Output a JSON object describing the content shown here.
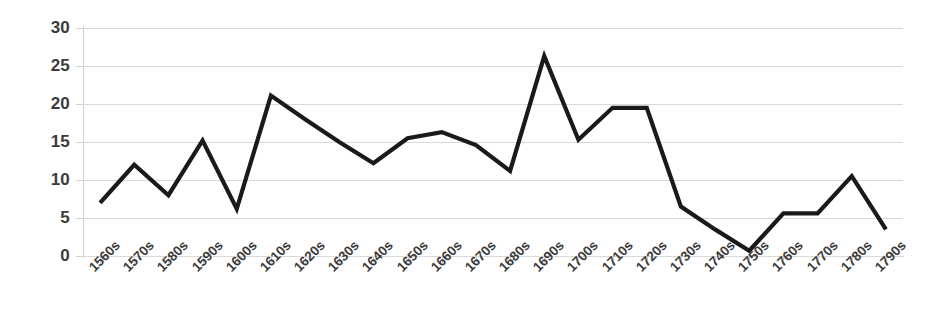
{
  "chart_data": {
    "type": "line",
    "title": "",
    "subtitle": "",
    "xlabel": "",
    "ylabel": "",
    "ylim": [
      0,
      30
    ],
    "ytick_step": 5,
    "grid": true,
    "legend": "none",
    "line_color": "#1a1a1a",
    "grid_color": "#d9d9d9",
    "axis_color": "#cfcfcf",
    "label_color": "#3b3b3b",
    "background": "#ffffff",
    "yticks": [
      "0",
      "5",
      "10",
      "15",
      "20",
      "25",
      "30"
    ],
    "categories": [
      "1560s",
      "1570s",
      "1580s",
      "1590s",
      "1600s",
      "1610s",
      "1620s",
      "1630s",
      "1640s",
      "1650s",
      "1660s",
      "1670s",
      "1680s",
      "1690s",
      "1700s",
      "1710s",
      "1720s",
      "1730s",
      "1740s",
      "1750s",
      "1760s",
      "1770s",
      "1780s",
      "1790s"
    ],
    "series": [
      {
        "name": "series-1",
        "values": [
          7.0,
          12.0,
          8.0,
          15.2,
          6.2,
          21.1,
          18.0,
          15.0,
          12.2,
          15.5,
          16.3,
          14.6,
          11.2,
          26.3,
          15.3,
          19.5,
          19.5,
          6.5,
          3.5,
          0.7,
          5.6,
          5.6,
          10.5,
          3.5
        ]
      }
    ]
  }
}
